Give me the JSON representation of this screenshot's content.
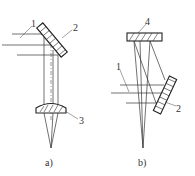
{
  "figure": {
    "panels": [
      {
        "id": "a",
        "caption": "a)",
        "labels": {
          "beam": "1",
          "mirror": "2",
          "lens": "3"
        }
      },
      {
        "id": "b",
        "caption": "b)",
        "labels": {
          "beam": "1",
          "mirror": "2",
          "concave_mirror": "4"
        }
      }
    ]
  }
}
